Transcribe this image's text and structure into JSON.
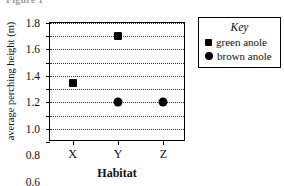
{
  "figure": {
    "caption": "Figure 1"
  },
  "chart_data": {
    "type": "scatter",
    "title": "",
    "xlabel": "Habitat",
    "ylabel": "average perching height (m)",
    "categories": [
      "X",
      "Y",
      "Z"
    ],
    "ylim": [
      0.0,
      1.8
    ],
    "yticks": [
      "0.0",
      "0.2",
      "0.4",
      "0.6",
      "0.8",
      "1.0",
      "1.2",
      "1.4",
      "1.6",
      "1.8"
    ],
    "ytick_values": [
      0.0,
      0.2,
      0.4,
      0.6,
      0.8,
      1.0,
      1.2,
      1.4,
      1.6,
      1.8
    ],
    "grid": true,
    "grid_axis": "y",
    "legend_position": "right",
    "series": [
      {
        "name": "green anole",
        "marker": "square",
        "color": "#000000",
        "points": [
          {
            "x": "X",
            "y": 0.9
          },
          {
            "x": "Y",
            "y": 1.6
          }
        ]
      },
      {
        "name": "brown anole",
        "marker": "circle",
        "color": "#000000",
        "points": [
          {
            "x": "Y",
            "y": 0.6
          },
          {
            "x": "Z",
            "y": 0.6
          }
        ]
      }
    ]
  },
  "legend": {
    "title": "Key",
    "entries": [
      {
        "label": "green anole",
        "marker": "square"
      },
      {
        "label": "brown anole",
        "marker": "circle"
      }
    ]
  }
}
